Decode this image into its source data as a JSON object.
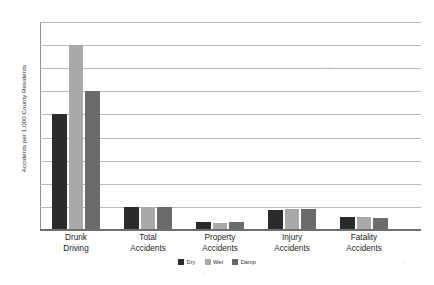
{
  "chart_data": {
    "type": "bar",
    "title": "",
    "xlabel": "",
    "ylabel": "Accidents per 1,000 County Residents",
    "ylim": [
      0,
      18
    ],
    "ytick_step": 2,
    "yticks": [
      0,
      2,
      4,
      6,
      8,
      10,
      12,
      14,
      16,
      18
    ],
    "grid": true,
    "legend_position": "bottom-center",
    "categories": [
      "Drunk Driving",
      "Total Accidents",
      "Property Accidents",
      "Injury Accidents",
      "Fatality Accidents"
    ],
    "category_lines": [
      [
        "Drunk",
        "Driving"
      ],
      [
        "Total",
        "Accidents"
      ],
      [
        "Property",
        "Accidents"
      ],
      [
        "Injury",
        "Accidents"
      ],
      [
        "Fatality",
        "Accidents"
      ]
    ],
    "series": [
      {
        "name": "Dry",
        "color": "#2b2b2b",
        "values": [
          10,
          2,
          0.7,
          1.7,
          1.1
        ]
      },
      {
        "name": "Wet",
        "color": "#a9a9a9",
        "values": [
          16,
          2,
          0.6,
          1.8,
          1.1
        ]
      },
      {
        "name": "Damp",
        "color": "#6b6b6b",
        "values": [
          12,
          2,
          0.7,
          1.8,
          1.0
        ]
      }
    ]
  },
  "colors": {
    "dry": "#2b2b2b",
    "wet": "#a9a9a9",
    "damp": "#6b6b6b",
    "gridline": "#b9b9b9",
    "axis": "#6e6e6e",
    "text": "#1c1c1c",
    "background": "#ffffff"
  }
}
